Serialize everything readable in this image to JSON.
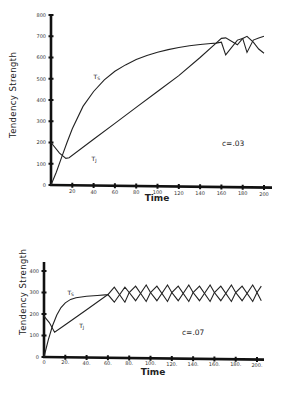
{
  "chart_data": [
    {
      "type": "line",
      "title": "",
      "xlabel": "Time",
      "ylabel": "Tendency Strength",
      "annotation": "c=.03",
      "xlim": [
        0,
        200
      ],
      "ylim": [
        0,
        800
      ],
      "xticks": [
        0,
        20,
        40,
        60,
        80,
        100,
        120,
        140,
        160,
        180,
        200
      ],
      "xtick_labels": [
        "",
        "20",
        "40",
        "60",
        "80",
        "100",
        "120",
        "140",
        "160",
        "180",
        "200"
      ],
      "yticks": [
        0,
        100,
        200,
        300,
        400,
        500,
        600,
        700,
        800
      ],
      "ytick_labels": [
        "0",
        "100",
        "200",
        "300",
        "400",
        "500",
        "600",
        "700",
        "800"
      ],
      "grid": false,
      "series": [
        {
          "name": "T_S",
          "label": "T",
          "subscript": "S",
          "points": [
            [
              0,
              0
            ],
            [
              5,
              60
            ],
            [
              10,
              130
            ],
            [
              15,
              200
            ],
            [
              20,
              265
            ],
            [
              30,
              370
            ],
            [
              40,
              440
            ],
            [
              50,
              495
            ],
            [
              60,
              535
            ],
            [
              70,
              565
            ],
            [
              80,
              590
            ],
            [
              90,
              610
            ],
            [
              100,
              625
            ],
            [
              110,
              637
            ],
            [
              120,
              647
            ],
            [
              130,
              655
            ],
            [
              140,
              661
            ],
            [
              150,
              666
            ],
            [
              155,
              668
            ],
            [
              160,
              672
            ],
            [
              164,
              612
            ],
            [
              175,
              682
            ],
            [
              180,
              690
            ],
            [
              184,
              624
            ],
            [
              190,
              682
            ],
            [
              195,
              692
            ],
            [
              200,
              700
            ]
          ]
        },
        {
          "name": "T_J",
          "label": "T",
          "subscript": "J",
          "points": [
            [
              0,
              200
            ],
            [
              8,
              150
            ],
            [
              14,
              125
            ],
            [
              17,
              128
            ],
            [
              40,
              215
            ],
            [
              60,
              290
            ],
            [
              80,
              365
            ],
            [
              100,
              440
            ],
            [
              120,
              515
            ],
            [
              140,
              600
            ],
            [
              155,
              668
            ],
            [
              160,
              690
            ],
            [
              164,
              692
            ],
            [
              175,
              660
            ],
            [
              180,
              690
            ],
            [
              184,
              700
            ],
            [
              190,
              672
            ],
            [
              195,
              640
            ],
            [
              200,
              620
            ]
          ]
        }
      ],
      "series_label_positions": [
        {
          "name": "T_S",
          "at": [
            40,
            500
          ]
        },
        {
          "name": "T_J",
          "at": [
            38,
            115
          ]
        }
      ]
    },
    {
      "type": "line",
      "title": "",
      "xlabel": "Time",
      "ylabel": "Tendency Strength",
      "annotation": "c=.07",
      "xlim": [
        0,
        200
      ],
      "ylim": [
        0,
        400
      ],
      "xticks": [
        0,
        20,
        40,
        60,
        80,
        100,
        120,
        140,
        160,
        180,
        200
      ],
      "xtick_labels": [
        "0",
        "20.",
        "40.",
        "60.",
        "80.",
        "100.",
        "120.",
        "140.",
        "160.",
        "180.",
        "200."
      ],
      "yticks": [
        0,
        100,
        200,
        300,
        400
      ],
      "ytick_labels": [
        "0",
        "100",
        "200",
        "300",
        "400"
      ],
      "grid": false,
      "series": [
        {
          "name": "T_S",
          "label": "T",
          "subscript": "S",
          "points": [
            [
              0,
              0
            ],
            [
              4,
              80
            ],
            [
              8,
              145
            ],
            [
              12,
              195
            ],
            [
              16,
              230
            ],
            [
              20,
              252
            ],
            [
              25,
              268
            ],
            [
              30,
              276
            ],
            [
              40,
              283
            ],
            [
              50,
              286
            ],
            [
              60,
              290
            ],
            [
              66,
              325
            ],
            [
              76,
              255
            ],
            [
              80,
              300
            ],
            [
              86,
              330
            ],
            [
              96,
              258
            ],
            [
              100,
              300
            ],
            [
              106,
              330
            ],
            [
              116,
              258
            ],
            [
              120,
              300
            ],
            [
              126,
              330
            ],
            [
              136,
              258
            ],
            [
              140,
              300
            ],
            [
              146,
              330
            ],
            [
              156,
              258
            ],
            [
              160,
              300
            ],
            [
              166,
              330
            ],
            [
              176,
              258
            ],
            [
              180,
              300
            ],
            [
              186,
              330
            ],
            [
              196,
              258
            ],
            [
              200,
              300
            ],
            [
              204,
              330
            ]
          ]
        },
        {
          "name": "T_J",
          "label": "T",
          "subscript": "J",
          "points": [
            [
              0,
              190
            ],
            [
              5,
              160
            ],
            [
              10,
              115
            ],
            [
              20,
              150
            ],
            [
              40,
              220
            ],
            [
              60,
              290
            ],
            [
              66,
              255
            ],
            [
              76,
              325
            ],
            [
              80,
              300
            ],
            [
              86,
              262
            ],
            [
              96,
              335
            ],
            [
              100,
              300
            ],
            [
              106,
              262
            ],
            [
              116,
              335
            ],
            [
              120,
              300
            ],
            [
              126,
              262
            ],
            [
              136,
              335
            ],
            [
              140,
              300
            ],
            [
              146,
              262
            ],
            [
              156,
              335
            ],
            [
              160,
              300
            ],
            [
              166,
              262
            ],
            [
              176,
              335
            ],
            [
              180,
              300
            ],
            [
              186,
              262
            ],
            [
              196,
              335
            ],
            [
              200,
              300
            ],
            [
              204,
              262
            ]
          ]
        }
      ],
      "series_label_positions": [
        {
          "name": "T_S",
          "at": [
            22,
            290
          ]
        },
        {
          "name": "T_J",
          "at": [
            33,
            135
          ]
        }
      ]
    }
  ]
}
